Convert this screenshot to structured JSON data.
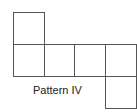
{
  "diagram": {
    "caption": "Pattern IV",
    "squares": [
      {
        "id": "top",
        "left": 13,
        "top": 12,
        "size": 32
      },
      {
        "id": "row-1",
        "left": 13,
        "top": 44,
        "size": 32
      },
      {
        "id": "row-2",
        "left": 44,
        "top": 44,
        "size": 31
      },
      {
        "id": "row-3",
        "left": 74,
        "top": 44,
        "size": 32
      },
      {
        "id": "row-4",
        "left": 105,
        "top": 44,
        "size": 32
      },
      {
        "id": "bottom",
        "left": 105,
        "top": 76,
        "size": 33
      }
    ],
    "line_color": "#555555"
  }
}
